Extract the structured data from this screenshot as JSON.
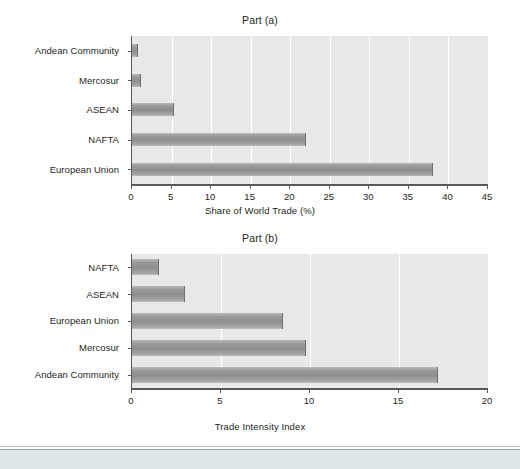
{
  "figure": {
    "background": "#ffffff",
    "plot_background": "#e8e8e8",
    "bar_color": "#9a9a9a",
    "axis_color": "#58595b",
    "text_color": "#231f20"
  },
  "chart_data": [
    {
      "type": "bar",
      "orientation": "horizontal",
      "title": "Part (a)",
      "categories": [
        "Andean Community",
        "Mercosur",
        "ASEAN",
        "NAFTA",
        "European Union"
      ],
      "values": [
        0.7,
        1.2,
        5.3,
        22.0,
        38.0
      ],
      "xlabel": "Share of World Trade (%)",
      "ylabel": "",
      "xlim": [
        0,
        45
      ],
      "xticks": [
        0,
        5,
        10,
        15,
        20,
        25,
        30,
        35,
        40,
        45
      ],
      "xticklabels": [
        "0",
        "5",
        "10",
        "15",
        "20",
        "25",
        "30",
        "35",
        "40",
        "45"
      ],
      "grid": "vertical",
      "legend": "none"
    },
    {
      "type": "bar",
      "orientation": "horizontal",
      "title": "Part (b)",
      "categories": [
        "NAFTA",
        "ASEAN",
        "European Union",
        "Mercosur",
        "Andean Community"
      ],
      "values": [
        1.5,
        3.0,
        8.5,
        9.8,
        17.2
      ],
      "xlabel": "Trade Intensity Index",
      "ylabel": "",
      "xlim": [
        0,
        20
      ],
      "xticks": [
        0,
        5,
        10,
        15,
        20
      ],
      "xticklabels": [
        "0",
        "5",
        "10",
        "15",
        "20"
      ],
      "grid": "vertical",
      "legend": "none"
    }
  ]
}
